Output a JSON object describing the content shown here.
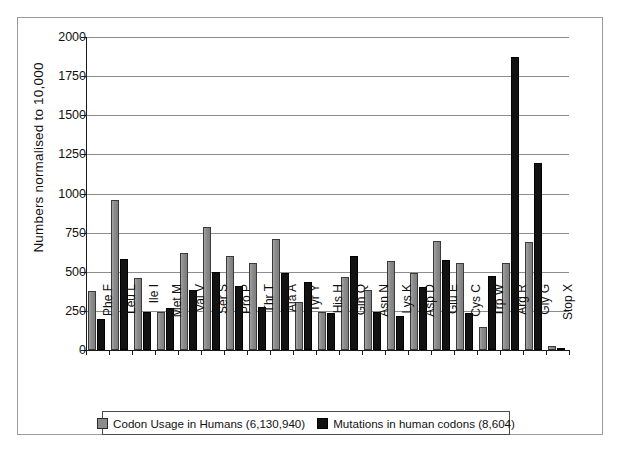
{
  "chart_data": {
    "type": "bar",
    "title": "",
    "xlabel": "",
    "ylabel": "Numbers normalised to 10,000",
    "ylim": [
      0,
      2000
    ],
    "ytick_step": 250,
    "yticks": [
      0,
      250,
      500,
      750,
      1000,
      1250,
      1500,
      1750,
      2000
    ],
    "grid": true,
    "legend_position": "bottom",
    "categories": [
      "Phe F",
      "Leu L",
      "Ile I",
      "Met M",
      "Val V",
      "Ser S",
      "Pro P",
      "Thr T",
      "Ala A",
      "Tyr Y",
      "His H",
      "Gln Q",
      "Asn N",
      "Lys K",
      "Asp D",
      "Glu E",
      "Cys C",
      "Trp W",
      "Arg R",
      "Gly G",
      "Stop X"
    ],
    "series": [
      {
        "name": "Codon Usage in Humans (6,130,940)",
        "color": "#8c8c8c",
        "values": [
          380,
          960,
          460,
          240,
          620,
          785,
          600,
          555,
          710,
          305,
          240,
          465,
          385,
          570,
          495,
          695,
          555,
          145,
          555,
          690,
          25
        ]
      },
      {
        "name": "Mutations in human codons (8,604)",
        "color": "#111111",
        "values": [
          195,
          580,
          245,
          270,
          385,
          500,
          410,
          275,
          490,
          435,
          235,
          600,
          245,
          215,
          405,
          575,
          235,
          470,
          1870,
          1195,
          15
        ]
      }
    ]
  },
  "legend": {
    "items": [
      {
        "label": "Codon Usage in Humans (6,130,940)",
        "swatch": "gray-swatch"
      },
      {
        "label": "Mutations in human codons (8,604)",
        "swatch": "black-swatch"
      }
    ]
  },
  "axes": {
    "y_title": "Numbers normalised to 10,000",
    "y_tick_labels": [
      "2000",
      "1750",
      "1500",
      "1250",
      "1000",
      "750",
      "500",
      "250",
      "0"
    ]
  }
}
